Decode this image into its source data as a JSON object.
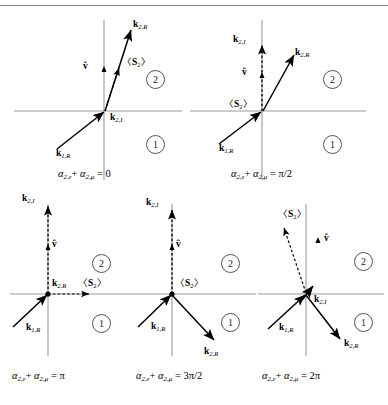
{
  "figure": {
    "panel_count": 5,
    "colors": {
      "axis": "#9a9a9a",
      "vector": "#000000",
      "border": "#8a8a8a",
      "region_circle": "#555555"
    },
    "common_labels": {
      "k1R": "k",
      "k1R_sub": "1,R",
      "k2R": "k",
      "k2R_sub": "2,R",
      "k2I": "k",
      "k2I_sub": "2,I",
      "vhat": "v̂",
      "spin": "〈S",
      "spin_sub": "2",
      "spin_close": "〉",
      "region_upper": "2",
      "region_lower": "1"
    }
  },
  "panels": [
    {
      "id": "panel-1",
      "caption_prefix": "α",
      "caption_sub1": "2,ε",
      "caption_plus": "+ ",
      "caption_alpha2": "α",
      "caption_sub2": "2,μ",
      "caption_value": "= 0",
      "caption_text": "α 2,ε + α 2,μ = 0",
      "vectors": {
        "k1R": {
          "label": "k",
          "sub": "1,R",
          "style": "solid"
        },
        "k2R": {
          "label": "k",
          "sub": "2,R",
          "style": "solid"
        },
        "k2I": {
          "label": "k",
          "sub": "2,I",
          "style": "solid"
        },
        "spin": {
          "label": "〈S₂〉",
          "style": "dashed"
        },
        "vhat": {
          "label": "v̂",
          "style": "tick"
        }
      }
    },
    {
      "id": "panel-2",
      "caption_prefix": "α",
      "caption_sub1": "2,ε",
      "caption_plus": "+ ",
      "caption_alpha2": "α",
      "caption_sub2": "2,μ",
      "caption_value": "= π/2",
      "caption_text": "α 2,ε + α 2,μ = π/2",
      "vectors": {
        "k1R": {
          "label": "k",
          "sub": "1,R",
          "style": "solid"
        },
        "k2R": {
          "label": "k",
          "sub": "2,R",
          "style": "solid"
        },
        "k2I": {
          "label": "k",
          "sub": "2,I",
          "style": "solid"
        },
        "spin": {
          "label": "〈S₂〉",
          "style": "dashed"
        },
        "vhat": {
          "label": "v̂",
          "style": "tick"
        }
      }
    },
    {
      "id": "panel-3",
      "caption_prefix": "α",
      "caption_sub1": "2,ε",
      "caption_plus": "+ ",
      "caption_alpha2": "α",
      "caption_sub2": "2,μ",
      "caption_value": "= π",
      "caption_text": "α 2,ε + α 2,μ = π",
      "vectors": {
        "k1R": {
          "label": "k",
          "sub": "1,R",
          "style": "solid"
        },
        "k2R": {
          "label": "k",
          "sub": "2,R",
          "style": "point"
        },
        "k2I": {
          "label": "k",
          "sub": "2,I",
          "style": "dashed"
        },
        "spin": {
          "label": "〈S₂〉",
          "style": "dashed"
        },
        "vhat": {
          "label": "v̂",
          "style": "tick"
        }
      }
    },
    {
      "id": "panel-4",
      "caption_prefix": "α",
      "caption_sub1": "2,ε",
      "caption_plus": "+ ",
      "caption_alpha2": "α",
      "caption_sub2": "2,μ",
      "caption_value": "= 3π/2",
      "caption_text": "α 2,ε + α 2,μ = 3π/2",
      "vectors": {
        "k1R": {
          "label": "k",
          "sub": "1,R",
          "style": "solid"
        },
        "k2R": {
          "label": "k",
          "sub": "2,R",
          "style": "solid"
        },
        "k2I": {
          "label": "k",
          "sub": "2,I",
          "style": "dashed"
        },
        "spin": {
          "label": "〈S₂〉",
          "style": "point"
        },
        "vhat": {
          "label": "v̂",
          "style": "tick"
        }
      }
    },
    {
      "id": "panel-5",
      "caption_prefix": "α",
      "caption_sub1": "2,ε",
      "caption_plus": "+ ",
      "caption_alpha2": "α",
      "caption_sub2": "2,μ",
      "caption_value": "= 2π",
      "caption_text": "α 2,ε + α 2,μ = 2π",
      "vectors": {
        "k1R": {
          "label": "k",
          "sub": "1,R",
          "style": "solid"
        },
        "k2R": {
          "label": "k",
          "sub": "2,R",
          "style": "solid"
        },
        "k2I": {
          "label": "k",
          "sub": "2,I",
          "style": "solid"
        },
        "spin": {
          "label": "〈S₂〉",
          "style": "dashed"
        },
        "vhat": {
          "label": "v̂",
          "style": "tick"
        }
      }
    }
  ]
}
